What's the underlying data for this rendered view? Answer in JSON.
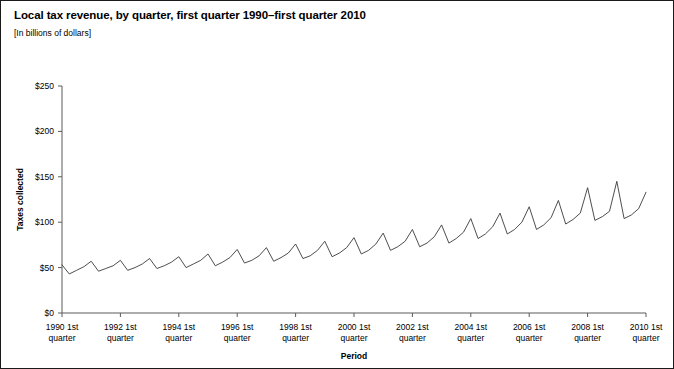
{
  "figure": {
    "title": "Local tax revenue, by quarter, first quarter 1990–first quarter 2010",
    "subtitle": "[In billions of dollars]"
  },
  "chart_data": {
    "type": "line",
    "title": "Local tax revenue, by quarter, first quarter 1990–first quarter 2010",
    "subtitle": "[In billions of dollars]",
    "xlabel": "Period",
    "ylabel": "Taxes collected",
    "ylim": [
      0,
      250
    ],
    "ytick_labels": [
      "$0",
      "$50",
      "$100",
      "$150",
      "$200",
      "$250"
    ],
    "ytick_values": [
      0,
      50,
      100,
      150,
      200,
      250
    ],
    "xtick_labels": [
      "1990 1st\nquarter",
      "1992 1st\nquarter",
      "1994 1st\nquarter",
      "1996 1st\nquarter",
      "1998 1st\nquarter",
      "2000 1st\nquarter",
      "2002 1st\nquarter",
      "2004 1st\nquarter",
      "2006 1st\nquarter",
      "2008 1st\nquarter",
      "2010 1st\nquarter"
    ],
    "xtick_labels_line1": [
      "1990 1st",
      "1992 1st",
      "1994 1st",
      "1996 1st",
      "1998 1st",
      "2000 1st",
      "2002 1st",
      "2004 1st",
      "2006 1st",
      "2008 1st",
      "2010 1st"
    ],
    "xtick_labels_line2": [
      "quarter",
      "quarter",
      "quarter",
      "quarter",
      "quarter",
      "quarter",
      "quarter",
      "quarter",
      "quarter",
      "quarter",
      "quarter"
    ],
    "xtick_quarter_index": [
      0,
      8,
      16,
      24,
      32,
      40,
      48,
      56,
      64,
      72,
      80
    ],
    "grid": false,
    "legend": false,
    "line_color": "#3a3a3a",
    "x": [
      "1990 Q1",
      "1990 Q2",
      "1990 Q3",
      "1990 Q4",
      "1991 Q1",
      "1991 Q2",
      "1991 Q3",
      "1991 Q4",
      "1992 Q1",
      "1992 Q2",
      "1992 Q3",
      "1992 Q4",
      "1993 Q1",
      "1993 Q2",
      "1993 Q3",
      "1993 Q4",
      "1994 Q1",
      "1994 Q2",
      "1994 Q3",
      "1994 Q4",
      "1995 Q1",
      "1995 Q2",
      "1995 Q3",
      "1995 Q4",
      "1996 Q1",
      "1996 Q2",
      "1996 Q3",
      "1996 Q4",
      "1997 Q1",
      "1997 Q2",
      "1997 Q3",
      "1997 Q4",
      "1998 Q1",
      "1998 Q2",
      "1998 Q3",
      "1998 Q4",
      "1999 Q1",
      "1999 Q2",
      "1999 Q3",
      "1999 Q4",
      "2000 Q1",
      "2000 Q2",
      "2000 Q3",
      "2000 Q4",
      "2001 Q1",
      "2001 Q2",
      "2001 Q3",
      "2001 Q4",
      "2002 Q1",
      "2002 Q2",
      "2002 Q3",
      "2002 Q4",
      "2003 Q1",
      "2003 Q2",
      "2003 Q3",
      "2003 Q4",
      "2004 Q1",
      "2004 Q2",
      "2004 Q3",
      "2004 Q4",
      "2005 Q1",
      "2005 Q2",
      "2005 Q3",
      "2005 Q4",
      "2006 Q1",
      "2006 Q2",
      "2006 Q3",
      "2006 Q4",
      "2007 Q1",
      "2007 Q2",
      "2007 Q3",
      "2007 Q4",
      "2008 Q1",
      "2008 Q2",
      "2008 Q3",
      "2008 Q4",
      "2009 Q1",
      "2009 Q2",
      "2009 Q3",
      "2009 Q4",
      "2010 Q1"
    ],
    "values": [
      53,
      43,
      47,
      51,
      57,
      46,
      49,
      52,
      58,
      47,
      50,
      54,
      60,
      49,
      52,
      56,
      62,
      50,
      54,
      58,
      65,
      52,
      56,
      61,
      70,
      55,
      58,
      63,
      72,
      57,
      61,
      66,
      76,
      60,
      63,
      69,
      79,
      62,
      66,
      72,
      83,
      65,
      69,
      76,
      88,
      69,
      73,
      79,
      92,
      73,
      77,
      84,
      97,
      77,
      82,
      89,
      104,
      82,
      87,
      95,
      110,
      87,
      92,
      100,
      117,
      92,
      97,
      105,
      124,
      98,
      103,
      110,
      138,
      102,
      106,
      112,
      145,
      104,
      108,
      115,
      133
    ]
  }
}
